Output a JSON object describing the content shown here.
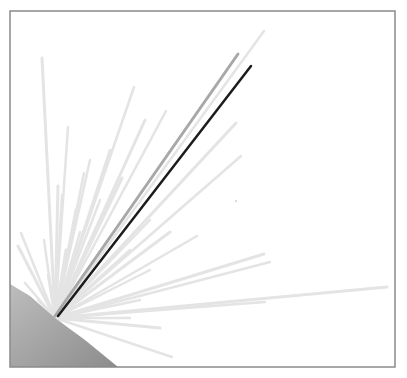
{
  "diagram": {
    "frame": {
      "x": 10,
      "y": 11,
      "width": 385,
      "height": 356,
      "stroke": "#8a8a8a"
    },
    "body": {
      "fill_light": "#b8b8b8",
      "fill_dark": "#8f8f8f",
      "arc": [
        [
          10,
          284
        ],
        [
          30,
          296
        ],
        [
          55,
          318
        ],
        [
          85,
          340
        ],
        [
          118,
          367
        ]
      ],
      "name": "planet-surface"
    },
    "origin": {
      "x": 55,
      "y": 318
    },
    "rays": {
      "background_color": "#e4e4e4",
      "background": [
        [
          42,
          58
        ],
        [
          68,
          127
        ],
        [
          84,
          173
        ],
        [
          58,
          186
        ],
        [
          44,
          240
        ],
        [
          21,
          233
        ],
        [
          18,
          246
        ],
        [
          25,
          283
        ],
        [
          62,
          195
        ],
        [
          76,
          210
        ],
        [
          90,
          160
        ],
        [
          134,
          87
        ],
        [
          145,
          120
        ],
        [
          166,
          111
        ],
        [
          110,
          150
        ],
        [
          122,
          178
        ],
        [
          100,
          200
        ],
        [
          264,
          31
        ],
        [
          236,
          123
        ],
        [
          241,
          156
        ],
        [
          150,
          220
        ],
        [
          170,
          232
        ],
        [
          197,
          236
        ],
        [
          130,
          250
        ],
        [
          264,
          254
        ],
        [
          270,
          262
        ],
        [
          150,
          270
        ],
        [
          387,
          287
        ],
        [
          265,
          302
        ],
        [
          140,
          300
        ],
        [
          160,
          328
        ],
        [
          130,
          318
        ],
        [
          172,
          357
        ],
        [
          72,
          335
        ],
        [
          38,
          300
        ],
        [
          48,
          275
        ],
        [
          66,
          250
        ],
        [
          80,
          232
        ]
      ],
      "highlighted": [
        {
          "name": "gray-ray",
          "end": [
            238,
            54
          ],
          "color": "#a8a8a8",
          "width": 3
        },
        {
          "name": "black-ray",
          "end": [
            251,
            66
          ],
          "color": "#1c1c1c",
          "width": 2.5
        }
      ]
    },
    "dot": {
      "x": 236,
      "y": 201,
      "color": "#c8c8c8"
    }
  }
}
